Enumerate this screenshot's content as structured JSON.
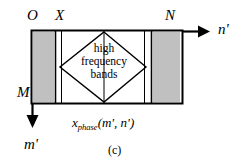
{
  "figure": {
    "caption": "(c)",
    "axes": {
      "horizontal_axis_label": "n'",
      "vertical_axis_label": "m'",
      "origin_label": "O",
      "x_mark_label": "X",
      "n_mark_label": "N",
      "m_mark_label": "M"
    },
    "region_label": {
      "line1": "high",
      "line2": "frequency",
      "line3": "bands"
    },
    "matrix_label": {
      "base": "x",
      "subscript": "phase",
      "args": "(m', n')",
      "full": "x_phase(m', n')"
    },
    "colors": {
      "stroke": "#000000",
      "shaded_block": "#c0c0c0",
      "background": "#ffffff"
    },
    "geometry": {
      "rect_left": 31,
      "rect_top": 30,
      "rect_right": 182,
      "rect_bottom": 104,
      "left_block_right": 56,
      "right_block_left": 152,
      "diamond_left_x": 60,
      "diamond_right_x": 146,
      "diamond_center_x": 104,
      "diamond_top_y": 32,
      "diamond_bottom_y": 102
    }
  }
}
